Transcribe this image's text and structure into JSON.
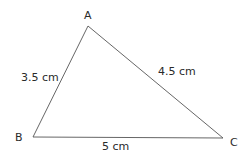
{
  "diagram": {
    "type": "triangle",
    "line_color": "#555555",
    "text_color": "#2a2a2a",
    "vertices": [
      {
        "name": "A",
        "x": 88,
        "y": 26
      },
      {
        "name": "B",
        "x": 33,
        "y": 137
      },
      {
        "name": "C",
        "x": 223,
        "y": 138
      }
    ],
    "sides": [
      {
        "from": "A",
        "to": "B",
        "label": "3.5 cm"
      },
      {
        "from": "A",
        "to": "C",
        "label": "4.5 cm"
      },
      {
        "from": "B",
        "to": "C",
        "label": "5 cm"
      }
    ]
  }
}
